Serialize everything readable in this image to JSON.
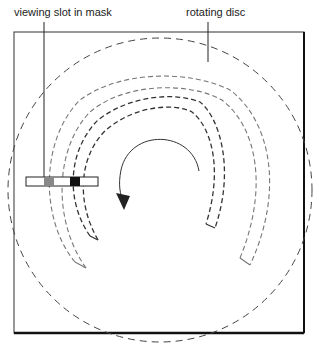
{
  "labels": {
    "slot": "viewing slot in mask",
    "disc": "rotating disc"
  },
  "colors": {
    "line": "#333333",
    "dash_light": "#777777",
    "slot_grey": "#888888",
    "slot_black": "#111111"
  }
}
